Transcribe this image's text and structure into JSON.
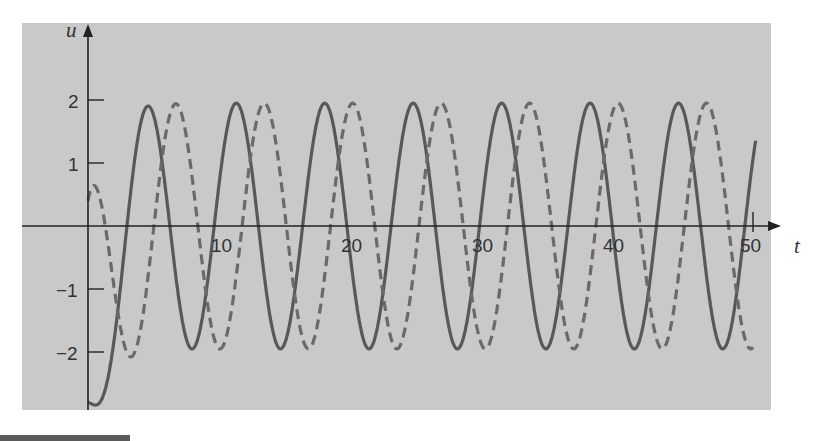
{
  "chart_data": {
    "type": "line",
    "title": "",
    "xlabel": "t",
    "ylabel": "u",
    "xlim": [
      0,
      50
    ],
    "ylim": [
      -3,
      2.5
    ],
    "grid": false,
    "legend": null,
    "x_ticks": [
      10,
      20,
      30,
      40,
      50
    ],
    "x_tick_labels": [
      "10",
      "20",
      "30",
      "40",
      "50"
    ],
    "y_ticks": [
      2,
      1,
      -1,
      -2
    ],
    "y_tick_labels": [
      "2",
      "1",
      "−1",
      "−2"
    ],
    "series": [
      {
        "name": "solid",
        "style": "solid",
        "color": "#555555",
        "description": "Starts at u≈-2.8 at t=0, rises to steady oscillation amplitude ≈2, period ≈6.65",
        "initial_value": -2.8,
        "amplitude": 1.95,
        "period": 6.65,
        "first_peak_t": 4.5,
        "peaks_t": [
          4.5,
          11.1,
          17.8,
          24.4,
          31.1,
          37.7,
          44.4
        ],
        "troughs_t": [
          7.8,
          14.4,
          21.1,
          27.7,
          34.4,
          41.0,
          47.7
        ],
        "t_end": 50
      },
      {
        "name": "dashed",
        "style": "dashed",
        "color": "#666666",
        "description": "Starts at u≈0.4 at t=0, dips to ≈-1.3 near t≈4, then steady oscillation amplitude ≈2 lagging solid by ≈2.2",
        "initial_value": 0.4,
        "first_trough": {
          "t": 4.0,
          "u": -1.3
        },
        "amplitude": 1.95,
        "period": 6.65,
        "peaks_t": [
          6.6,
          13.3,
          19.9,
          26.6,
          33.3,
          39.9,
          46.6
        ],
        "troughs_t": [
          10.0,
          16.6,
          23.3,
          29.9,
          36.6,
          43.2,
          49.9
        ],
        "t_end": 50
      }
    ]
  },
  "axes": {
    "x_label": "t",
    "y_label": "u"
  },
  "ticks": {
    "x": [
      "10",
      "20",
      "30",
      "40",
      "50"
    ],
    "y": [
      "2",
      "1",
      "−1",
      "−2"
    ]
  }
}
